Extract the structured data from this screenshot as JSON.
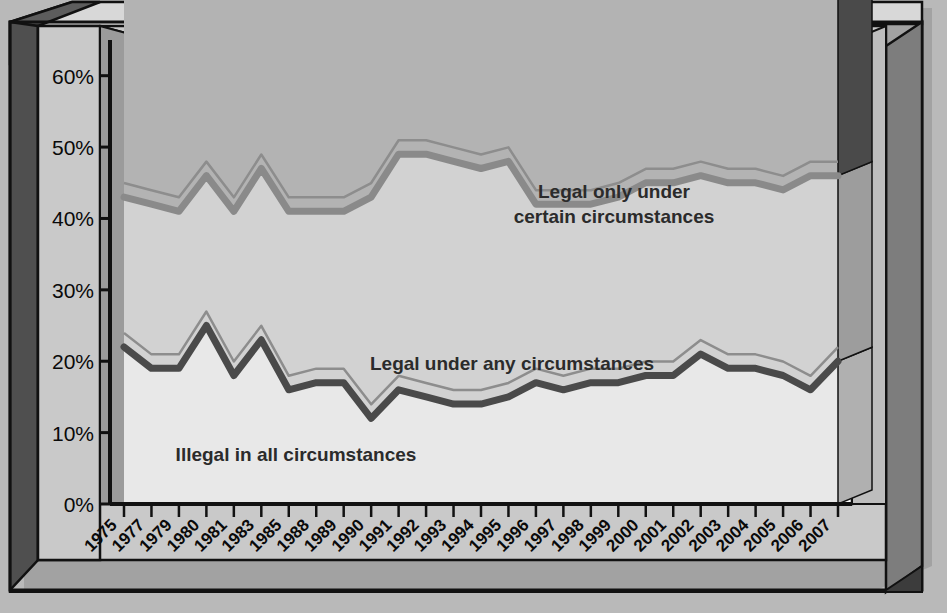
{
  "chart_data": {
    "type": "area",
    "title": "",
    "subtitle": "",
    "xlabel": "",
    "ylabel": "",
    "stacked": true,
    "grid": false,
    "legend_position": "inline-annotations",
    "ylim": [
      0,
      65
    ],
    "ytick_labels": [
      "0%",
      "10%",
      "20%",
      "30%",
      "40%",
      "50%",
      "60%"
    ],
    "ytick_values": [
      0,
      10,
      20,
      30,
      40,
      50,
      60
    ],
    "categories": [
      "1975",
      "1977",
      "1979",
      "1980",
      "1981",
      "1983",
      "1985",
      "1988",
      "1989",
      "1990",
      "1991",
      "1992",
      "1993",
      "1994",
      "1995",
      "1996",
      "1997",
      "1998",
      "1999",
      "2000",
      "2001",
      "2002",
      "2003",
      "2004",
      "2005",
      "2006",
      "2007"
    ],
    "series": [
      {
        "name": "Illegal in all circumstances",
        "color": "#4a4a4a",
        "fill": "#e8e8e8",
        "values": [
          22,
          19,
          19,
          25,
          18,
          23,
          16,
          17,
          17,
          12,
          16,
          15,
          14,
          14,
          15,
          17,
          16,
          17,
          17,
          18,
          18,
          21,
          19,
          19,
          18,
          16,
          20
        ]
      },
      {
        "name": "Legal under any circumstances",
        "color": "#8a8a8a",
        "fill": "#d2d2d2",
        "values": [
          21,
          23,
          22,
          21,
          23,
          24,
          25,
          24,
          24,
          31,
          33,
          34,
          34,
          33,
          33,
          25,
          26,
          25,
          26,
          27,
          27,
          25,
          26,
          26,
          26,
          30,
          26
        ]
      },
      {
        "name": "Legal only under certain circumstances",
        "color": "#666666",
        "fill": "#b3b3b3",
        "values": [
          54,
          55,
          54,
          53,
          52,
          58,
          58,
          57,
          51,
          53,
          56,
          52,
          51,
          52,
          54,
          52,
          61,
          61,
          59,
          56,
          57,
          57,
          55,
          57,
          56,
          55,
          52
        ]
      }
    ],
    "annotations": [
      {
        "text_line1": "Legal only under",
        "text_line2": "certain circumstances",
        "x": 614,
        "y": 198
      },
      {
        "text_line1": "Legal under any circumstances",
        "text_line2": "",
        "x": 512,
        "y": 370
      },
      {
        "text_line1": "Illegal in all circumstances",
        "text_line2": "",
        "x": 296,
        "y": 461
      }
    ]
  },
  "colors": {
    "page_background": "#b9b9b9",
    "plot_background": "#ffffff",
    "frame_face": "#c9c9c9",
    "frame_dark": "#585858",
    "frame_shadow": "#3a3a3a",
    "axis_line": "#111111",
    "text": "#0a0a0a"
  }
}
